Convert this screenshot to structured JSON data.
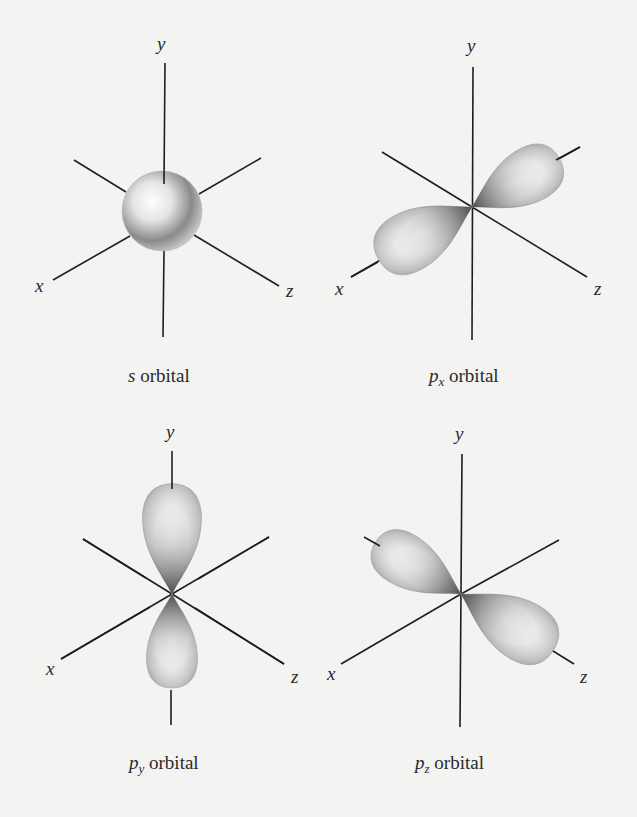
{
  "figure": {
    "background": "#f3f3f1",
    "panels": [
      {
        "id": "s",
        "caption": {
          "symbol": "s",
          "subscript": "",
          "label": "orbital"
        },
        "axes": {
          "x": "x",
          "y": "y",
          "z": "z"
        }
      },
      {
        "id": "px",
        "caption": {
          "symbol": "p",
          "subscript": "x",
          "label": "orbital"
        },
        "axes": {
          "x": "x",
          "y": "y",
          "z": "z"
        }
      },
      {
        "id": "py",
        "caption": {
          "symbol": "p",
          "subscript": "y",
          "label": "orbital"
        },
        "axes": {
          "x": "x",
          "y": "y",
          "z": "z"
        }
      },
      {
        "id": "pz",
        "caption": {
          "symbol": "p",
          "subscript": "z",
          "label": "orbital"
        },
        "axes": {
          "x": "x",
          "y": "y",
          "z": "z"
        }
      }
    ]
  }
}
